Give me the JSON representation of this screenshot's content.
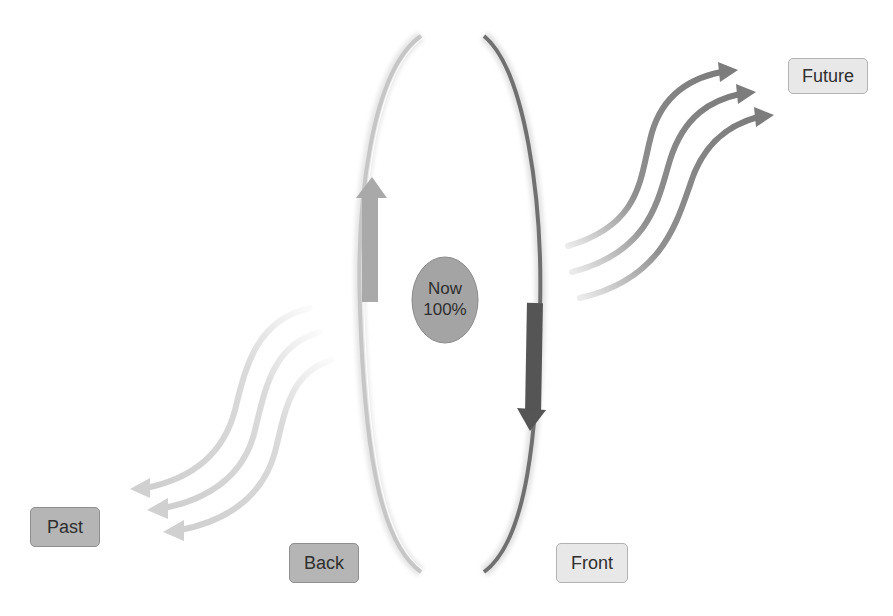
{
  "diagram": {
    "center": {
      "line1": "Now",
      "line2": "100%",
      "fill": "#a4a4a4"
    },
    "labels": {
      "past": "Past",
      "back": "Back",
      "front": "Front",
      "future": "Future"
    },
    "colors": {
      "back_arc": "#c6c6c6",
      "front_arc": "#707070",
      "up_arrow": "#a9a9a9",
      "down_arrow": "#555555",
      "future_arrows": "#7c7c7c",
      "past_arrows": "#d6d6d6",
      "dark_label_fill": "#b5b5b5",
      "light_label_fill": "#e8e8e8"
    },
    "future_arrow_count": 3,
    "past_arrow_count": 3
  }
}
